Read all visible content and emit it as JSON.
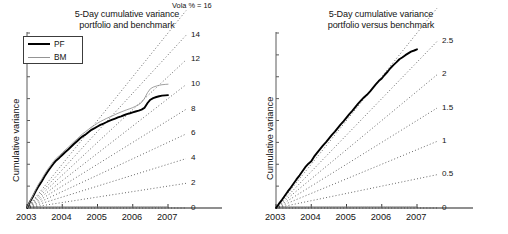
{
  "figure": {
    "background": "#ffffff",
    "panels": [
      "left",
      "right"
    ]
  },
  "panel_left": {
    "title_line1": "5-Day cumulative variance",
    "title_line2": "portfolio and benchmark",
    "ylabel": "Cumulative variance",
    "legend": {
      "items": [
        {
          "label": "PF",
          "color": "#000000",
          "width": 2,
          "icon": "line-swatch-icon"
        },
        {
          "label": "BM",
          "color": "#949494",
          "width": 1,
          "icon": "line-swatch-icon"
        }
      ]
    },
    "xticks": [
      "2003",
      "2004",
      "2005",
      "2006",
      "2007"
    ],
    "vola_head": "Vola % = 16",
    "vola_labels": [
      "14",
      "12",
      "10",
      "8",
      "6",
      "4",
      "2",
      "0"
    ]
  },
  "panel_right": {
    "title_line1": "5-Day cumulative variance",
    "title_line2": "portfolio versus benchmark",
    "ylabel": "Cumulative variance",
    "xticks": [
      "2003",
      "2004",
      "2005",
      "2006",
      "2007"
    ],
    "vola_head": "Vola % = 3",
    "vola_labels": [
      "2.5",
      "2",
      "1.5",
      "1",
      "0.5",
      "0"
    ]
  },
  "chart_data": [
    {
      "type": "line",
      "panel": "left",
      "title": "5-Day cumulative variance portfolio and benchmark",
      "xlabel": "",
      "ylabel": "Cumulative variance",
      "xlim": [
        2003.0,
        2007.0
      ],
      "ylim": [
        0,
        16
      ],
      "grid": false,
      "legend_position": "top-left",
      "xtick_labels": [
        "2003",
        "2004",
        "2005",
        "2006",
        "2007"
      ],
      "xtick_values": [
        2003,
        2004,
        2005,
        2006,
        2007
      ],
      "reference_rays": {
        "note": "dotted straight lines from origin labelled by annualised volatility in percent; right-hand label is the value reached at 2007",
        "label_prefix": "Vola % =",
        "values": [
          16,
          14,
          12,
          10,
          8,
          6,
          4,
          2,
          0
        ]
      },
      "series": [
        {
          "name": "PF",
          "color": "#000000",
          "style": "solid-thick",
          "x": [
            2003.0,
            2003.08,
            2003.17,
            2003.25,
            2003.33,
            2003.42,
            2003.5,
            2003.58,
            2003.67,
            2003.75,
            2003.83,
            2003.92,
            2004.0,
            2004.08,
            2004.17,
            2004.25,
            2004.33,
            2004.42,
            2004.5,
            2004.58,
            2004.67,
            2004.75,
            2004.83,
            2004.92,
            2005.0,
            2005.08,
            2005.17,
            2005.25,
            2005.33,
            2005.42,
            2005.5,
            2005.58,
            2005.67,
            2005.75,
            2005.83,
            2005.92,
            2006.0,
            2006.08,
            2006.17,
            2006.25,
            2006.33,
            2006.42,
            2006.5,
            2006.58,
            2006.67,
            2006.75,
            2006.83,
            2006.92,
            2007.0
          ],
          "y": [
            0.0,
            0.55,
            1.05,
            1.55,
            2.0,
            2.45,
            2.9,
            3.3,
            3.7,
            4.05,
            4.35,
            4.6,
            4.85,
            5.1,
            5.35,
            5.6,
            5.85,
            6.1,
            6.35,
            6.55,
            6.75,
            6.95,
            7.15,
            7.3,
            7.45,
            7.6,
            7.72,
            7.84,
            7.96,
            8.08,
            8.18,
            8.28,
            8.38,
            8.48,
            8.58,
            8.66,
            8.74,
            8.82,
            8.9,
            9.0,
            9.15,
            9.6,
            9.9,
            10.05,
            10.15,
            10.22,
            10.27,
            10.3,
            10.32
          ]
        },
        {
          "name": "BM",
          "color": "#949494",
          "style": "solid-thin",
          "x": [
            2003.0,
            2003.08,
            2003.17,
            2003.25,
            2003.33,
            2003.42,
            2003.5,
            2003.58,
            2003.67,
            2003.75,
            2003.83,
            2003.92,
            2004.0,
            2004.08,
            2004.17,
            2004.25,
            2004.33,
            2004.42,
            2004.5,
            2004.58,
            2004.67,
            2004.75,
            2004.83,
            2004.92,
            2005.0,
            2005.08,
            2005.17,
            2005.25,
            2005.33,
            2005.42,
            2005.5,
            2005.58,
            2005.67,
            2005.75,
            2005.83,
            2005.92,
            2006.0,
            2006.08,
            2006.17,
            2006.25,
            2006.33,
            2006.42,
            2006.5,
            2006.58,
            2006.67,
            2006.75,
            2006.83,
            2006.92,
            2007.0
          ],
          "y": [
            0.0,
            0.6,
            1.15,
            1.7,
            2.2,
            2.65,
            3.1,
            3.5,
            3.9,
            4.25,
            4.55,
            4.8,
            5.05,
            5.3,
            5.55,
            5.8,
            6.05,
            6.3,
            6.55,
            6.78,
            7.0,
            7.2,
            7.4,
            7.58,
            7.75,
            7.9,
            8.05,
            8.18,
            8.3,
            8.42,
            8.54,
            8.66,
            8.78,
            8.88,
            8.98,
            9.08,
            9.18,
            9.3,
            9.45,
            9.65,
            10.0,
            10.55,
            10.9,
            11.05,
            11.15,
            11.22,
            11.27,
            11.3,
            11.32
          ]
        }
      ]
    },
    {
      "type": "line",
      "panel": "right",
      "title": "5-Day cumulative variance portfolio versus benchmark",
      "xlabel": "",
      "ylabel": "Cumulative variance",
      "xlim": [
        2003.0,
        2007.0
      ],
      "ylim": [
        0,
        3
      ],
      "grid": false,
      "legend_position": "none",
      "xtick_labels": [
        "2003",
        "2004",
        "2005",
        "2006",
        "2007"
      ],
      "xtick_values": [
        2003,
        2004,
        2005,
        2006,
        2007
      ],
      "reference_rays": {
        "note": "dotted straight lines from origin labelled by annualised tracking-error volatility in percent",
        "label_prefix": "Vola % =",
        "values": [
          3,
          2.5,
          2,
          1.5,
          1,
          0.5,
          0
        ]
      },
      "series": [
        {
          "name": "PF vs BM",
          "color": "#000000",
          "style": "solid-thick",
          "x": [
            2003.0,
            2003.08,
            2003.17,
            2003.25,
            2003.33,
            2003.42,
            2003.5,
            2003.58,
            2003.67,
            2003.75,
            2003.83,
            2003.92,
            2004.0,
            2004.08,
            2004.17,
            2004.25,
            2004.33,
            2004.42,
            2004.5,
            2004.58,
            2004.67,
            2004.75,
            2004.83,
            2004.92,
            2005.0,
            2005.08,
            2005.17,
            2005.25,
            2005.33,
            2005.42,
            2005.5,
            2005.58,
            2005.67,
            2005.75,
            2005.83,
            2005.92,
            2006.0,
            2006.08,
            2006.17,
            2006.25,
            2006.33,
            2006.42,
            2006.5,
            2006.58,
            2006.67,
            2006.75,
            2006.83,
            2006.92,
            2007.0
          ],
          "y": [
            0.0,
            0.07,
            0.14,
            0.21,
            0.28,
            0.35,
            0.42,
            0.49,
            0.56,
            0.63,
            0.7,
            0.76,
            0.8,
            0.88,
            0.95,
            1.01,
            1.07,
            1.13,
            1.19,
            1.25,
            1.31,
            1.37,
            1.43,
            1.49,
            1.55,
            1.61,
            1.67,
            1.73,
            1.79,
            1.85,
            1.9,
            1.94,
            2.0,
            2.06,
            2.12,
            2.18,
            2.22,
            2.28,
            2.34,
            2.4,
            2.45,
            2.5,
            2.55,
            2.58,
            2.62,
            2.65,
            2.68,
            2.7,
            2.72
          ]
        }
      ]
    }
  ]
}
